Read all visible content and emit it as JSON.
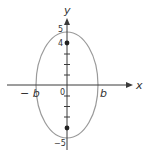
{
  "figure": {
    "type": "ellipse-on-axes",
    "axes": {
      "x_label": "x",
      "y_label": "y",
      "origin_label": "0"
    },
    "ellipse": {
      "center": [
        0,
        0
      ],
      "x_intercepts": [
        "-b",
        "b"
      ],
      "y_intercepts": [
        5,
        -5
      ]
    },
    "y_tick_labels": {
      "top": "5",
      "focus": "4",
      "bottom": "−5"
    },
    "x_tick_labels": {
      "left": "− b",
      "right": "b"
    },
    "marked_points": [
      {
        "label": "focus-top",
        "y": 4
      },
      {
        "label": "focus-bottom",
        "y": -4
      }
    ],
    "colors": {
      "axes": "#3a3a3a",
      "ellipse": "#9a9a9a",
      "points": "#222222",
      "text": "#333333"
    }
  }
}
